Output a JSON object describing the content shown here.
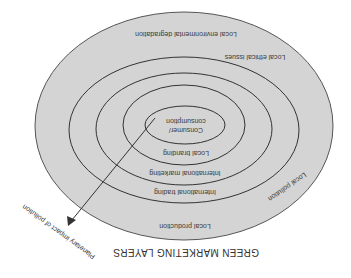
{
  "diagram": {
    "title": "GREEN MARKETING LAYERS",
    "orientation": "rotated 180 degrees",
    "colors": {
      "fill": "#d4d4d4",
      "stroke": "#444444",
      "background": "#ffffff"
    },
    "layers": [
      {
        "label": "Local environmental degradation"
      },
      {
        "label": "Local ethical issues"
      },
      {
        "label": "Local pollution"
      },
      {
        "label": "Local production"
      },
      {
        "label": "International trading"
      },
      {
        "label": "International marketing"
      },
      {
        "label": "Local branding"
      },
      {
        "label": "Consumer/",
        "label2": "consumption"
      }
    ],
    "arrow": {
      "label": "Planetary impact of pollution"
    }
  }
}
